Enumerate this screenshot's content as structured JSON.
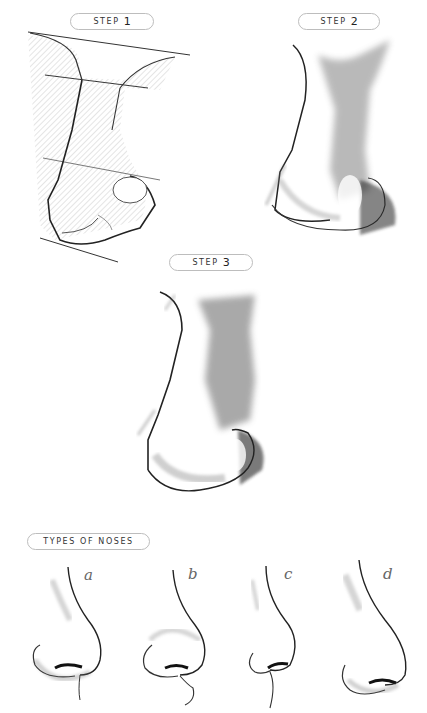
{
  "steps": [
    {
      "label": "STEP",
      "number": "1",
      "description": "construction-sketch"
    },
    {
      "label": "STEP",
      "number": "2",
      "description": "initial-shading"
    },
    {
      "label": "STEP",
      "number": "3",
      "description": "finished-rendering"
    }
  ],
  "types_section": {
    "label": "TYPES OF NOSES",
    "variants": [
      {
        "letter": "a"
      },
      {
        "letter": "b"
      },
      {
        "letter": "c"
      },
      {
        "letter": "d"
      }
    ]
  },
  "colors": {
    "background": "#ffffff",
    "pill_border": "#bdbdbd",
    "ink": "#222222",
    "shade": "#555555"
  }
}
